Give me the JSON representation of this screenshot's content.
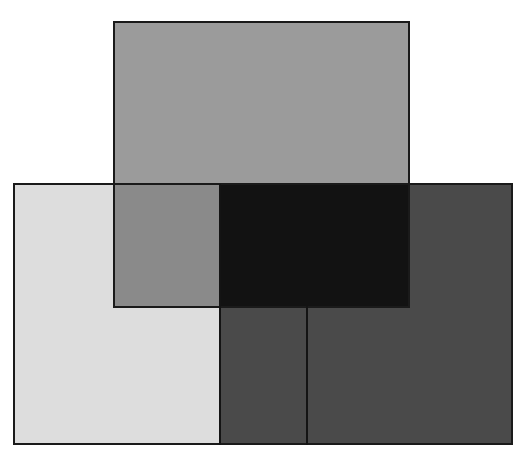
{
  "figure": {
    "canvas": {
      "width": 524,
      "height": 454,
      "background": "#ffffff"
    },
    "colors": {
      "top_rect_only": "#9b9b9b",
      "bottom_left_light": "#dddddd",
      "overlap_top_with_light": "#8a8a8a",
      "bottom_dark": "#4a4a4a",
      "overlap_top_with_dark": "#121212",
      "outline": "#1a1a1a"
    },
    "rectangles": [
      {
        "name": "top-rectangle",
        "x": 113,
        "y": 21,
        "w": 297,
        "h": 286
      },
      {
        "name": "bottom-rectangle",
        "x": 13,
        "y": 184,
        "w": 500,
        "h": 261
      }
    ],
    "dividers": [
      {
        "name": "divider-left",
        "x": 220,
        "y1": 184,
        "y2": 445
      },
      {
        "name": "divider-right",
        "x": 307,
        "y1": 306,
        "y2": 445
      }
    ]
  }
}
